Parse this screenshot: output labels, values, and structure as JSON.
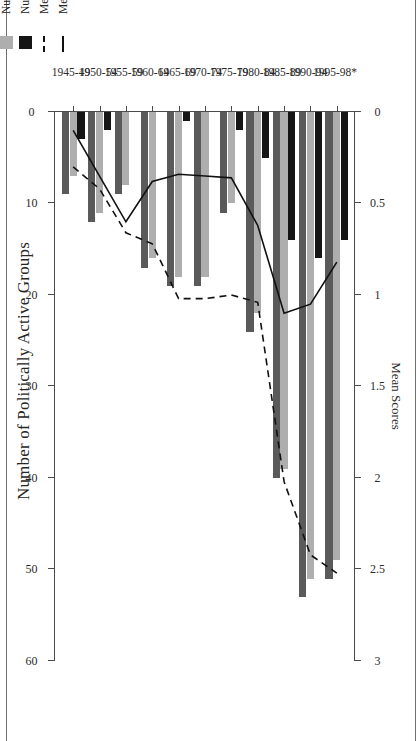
{
  "figure": {
    "top_axis_title": "Number of Politically Active Groups",
    "bottom_axis_title": "Mean Scores"
  },
  "legend": {
    "items": [
      {
        "label": "Mean Rebellion (All Groups)",
        "swatch": "solid-line",
        "color": "#111111"
      },
      {
        "label": "Mean Protest (All Groups)",
        "swatch": "dashed-line",
        "color": "#111111"
      },
      {
        "label": "Number of Groups Using Rebellion",
        "swatch": "filled-square",
        "color": "#151515"
      },
      {
        "label": "Number of Groups Using Protest",
        "swatch": "filled-square",
        "color": "#aeaeae"
      },
      {
        "label": "Number of Active Groups",
        "swatch": "filled-square",
        "color": "#5a5a5a"
      }
    ]
  },
  "chart_data": {
    "type": "bar",
    "title": "Number of Politically Active Groups",
    "xlabel": "",
    "ylabel": "Number of Politically Active Groups",
    "y2label": "Mean Scores",
    "orientation": "horizontal-rotated",
    "grid": false,
    "legend_position": "inside-right",
    "count_axis": {
      "label": "Number of Politically Active Groups",
      "ticks": [
        0,
        10,
        20,
        30,
        40,
        50,
        60
      ],
      "tick_labels": [
        "0",
        "10",
        "20",
        "30",
        "40",
        "50",
        "60"
      ],
      "lim": [
        0,
        60
      ],
      "direction": "reversed"
    },
    "score_axis": {
      "label": "Mean Scores",
      "ticks": [
        0,
        0.5,
        1,
        1.5,
        2,
        2.5,
        3
      ],
      "tick_labels": [
        "0",
        "0.5",
        "1",
        "1.5",
        "2",
        "2.5",
        "3"
      ],
      "lim": [
        0,
        3
      ],
      "direction": "reversed"
    },
    "categories": [
      "1945-49",
      "1950-54",
      "1955-59",
      "1960-64",
      "1965-69",
      "1970-74",
      "1975-79",
      "1980-84",
      "1985-89",
      "1990-94",
      "1995-98*"
    ],
    "series": [
      {
        "name": "Number of Active Groups",
        "type": "bar",
        "color": "#5a5a5a",
        "axis": "count",
        "values": [
          9,
          12,
          9,
          17,
          19,
          19,
          11,
          24,
          40,
          53,
          51
        ]
      },
      {
        "name": "Number of Groups Using Protest",
        "type": "bar",
        "color": "#aeaeae",
        "axis": "count",
        "values": [
          7,
          11,
          8,
          16,
          18,
          18,
          10,
          22,
          39,
          51,
          49
        ]
      },
      {
        "name": "Number of Groups Using Rebellion",
        "type": "bar",
        "color": "#151515",
        "axis": "count",
        "values": [
          3,
          2,
          0,
          0,
          1,
          0,
          2,
          5,
          14,
          16,
          14
        ]
      },
      {
        "name": "Mean Rebellion (All Groups)",
        "type": "line",
        "style": "solid",
        "color": "#111111",
        "axis": "score",
        "values": [
          0.1,
          0.35,
          0.6,
          0.38,
          0.34,
          0.35,
          0.36,
          0.62,
          1.1,
          1.05,
          0.82
        ]
      },
      {
        "name": "Mean Protest (All Groups)",
        "type": "line",
        "style": "dashed",
        "color": "#111111",
        "axis": "score",
        "values": [
          0.3,
          0.42,
          0.66,
          0.72,
          1.02,
          1.02,
          1.0,
          1.04,
          2.02,
          2.42,
          2.52
        ]
      }
    ]
  }
}
